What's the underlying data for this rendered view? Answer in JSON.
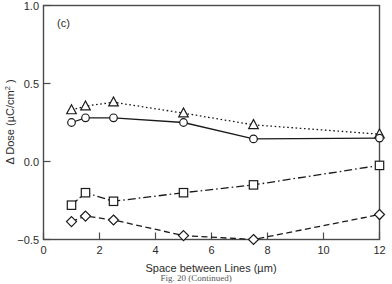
{
  "figure": {
    "panel_label": "(c)",
    "caption": "Fig. 20   (Continued)"
  },
  "chart_data": {
    "type": "line",
    "title": "",
    "panel": "(c)",
    "xlabel": "Space between Lines (µm)",
    "ylabel": "Δ Dose (µC/cm²)",
    "xlim": [
      0,
      12
    ],
    "ylim": [
      -0.5,
      1.0
    ],
    "xticks": [
      0,
      2,
      4,
      6,
      8,
      10,
      12
    ],
    "xtick_labels": [
      "0",
      "2",
      "4",
      "6",
      "8",
      "10",
      "12"
    ],
    "yticks": [
      -0.5,
      0.0,
      0.5,
      1.0
    ],
    "ytick_labels": [
      "−0.5",
      "0.0",
      "0.5",
      "1.0"
    ],
    "grid": false,
    "legend": "none",
    "series": [
      {
        "name": "triangle-series",
        "marker": "triangle-up-open",
        "linestyle": "dotted",
        "color": "#1a1a1a",
        "x": [
          1.0,
          1.5,
          2.5,
          5.0,
          7.5,
          12.0
        ],
        "values": [
          0.33,
          0.355,
          0.38,
          0.31,
          0.235,
          0.175
        ]
      },
      {
        "name": "circle-series",
        "marker": "circle-open",
        "linestyle": "solid",
        "color": "#1a1a1a",
        "x": [
          1.0,
          1.5,
          2.5,
          5.0,
          7.5,
          12.0
        ],
        "values": [
          0.25,
          0.28,
          0.28,
          0.25,
          0.145,
          0.15
        ]
      },
      {
        "name": "square-series",
        "marker": "square-open",
        "linestyle": "dashdot",
        "color": "#1a1a1a",
        "x": [
          1.0,
          1.5,
          2.5,
          5.0,
          7.5,
          12.0
        ],
        "values": [
          -0.28,
          -0.2,
          -0.255,
          -0.2,
          -0.15,
          -0.025
        ]
      },
      {
        "name": "diamond-series",
        "marker": "diamond-open",
        "linestyle": "dashed",
        "color": "#1a1a1a",
        "x": [
          1.0,
          1.5,
          2.5,
          5.0,
          7.5,
          12.0
        ],
        "values": [
          -0.385,
          -0.35,
          -0.375,
          -0.475,
          -0.5,
          -0.34
        ]
      }
    ]
  },
  "axes": {
    "x_title_main": "Space between Lines (",
    "x_title_unit": "µm",
    "x_title_close": ")",
    "y_title_main": "Δ Dose (",
    "y_title_unit": "µC/cm",
    "y_title_sup": "2",
    "y_title_close": " )"
  }
}
